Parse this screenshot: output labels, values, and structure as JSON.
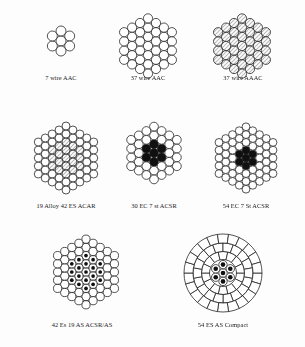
{
  "figure": {
    "background_color": "#fdfdfd",
    "stroke_color": "#1a1a1a",
    "fill_white": "#ffffff",
    "fill_hatched": "#b9b9b9",
    "fill_black": "#101010"
  },
  "diagrams": [
    {
      "id": "d1",
      "label": "7 wire AAC",
      "type": "round-strand",
      "total_wires": 7,
      "layers": [
        {
          "count": 1,
          "radius_factor": 0.0,
          "fill": "white"
        },
        {
          "count": 6,
          "radius_factor": 1.0,
          "fill": "white"
        }
      ],
      "wire_radius": 5.0,
      "outer_radius": 15,
      "core_fill": "white",
      "outer_fill": "white"
    },
    {
      "id": "d2",
      "label": "37 wire AAC",
      "type": "round-strand",
      "total_wires": 37,
      "layers": [
        {
          "count": 1,
          "radius_factor": 0.0,
          "fill": "white"
        },
        {
          "count": 6,
          "radius_factor": 1.0,
          "fill": "white"
        },
        {
          "count": 12,
          "radius_factor": 2.0,
          "fill": "white"
        },
        {
          "count": 18,
          "radius_factor": 3.0,
          "fill": "white"
        }
      ],
      "wire_radius": 4.6,
      "outer_radius": 32,
      "core_fill": "white",
      "outer_fill": "white"
    },
    {
      "id": "d3",
      "label": "37 wire AAAC",
      "type": "round-strand",
      "total_wires": 37,
      "layers": [
        {
          "count": 1,
          "radius_factor": 0.0,
          "fill": "hatched"
        },
        {
          "count": 6,
          "radius_factor": 1.0,
          "fill": "hatched"
        },
        {
          "count": 12,
          "radius_factor": 2.0,
          "fill": "hatched"
        },
        {
          "count": 18,
          "radius_factor": 3.0,
          "fill": "hatched"
        }
      ],
      "wire_radius": 4.6,
      "outer_radius": 32,
      "core_fill": "hatched",
      "outer_fill": "hatched"
    },
    {
      "id": "d4",
      "label": "19 Alloy 42 ES ACAR",
      "type": "round-strand",
      "total_wires": 61,
      "layers": [
        {
          "count": 1,
          "radius_factor": 0.0,
          "fill": "hatched"
        },
        {
          "count": 6,
          "radius_factor": 1.0,
          "fill": "hatched"
        },
        {
          "count": 12,
          "radius_factor": 2.0,
          "fill": "hatched"
        },
        {
          "count": 18,
          "radius_factor": 3.0,
          "fill": "white"
        },
        {
          "count": 24,
          "radius_factor": 4.0,
          "fill": "white"
        }
      ],
      "wire_radius": 4.0,
      "outer_radius": 36,
      "core_fill": "hatched",
      "outer_fill": "white"
    },
    {
      "id": "d5",
      "label": "30 EC 7 st ACSR",
      "type": "round-strand-steel-core",
      "total_wires": 37,
      "layers": [
        {
          "count": 1,
          "radius_factor": 0.0,
          "fill": "black"
        },
        {
          "count": 6,
          "radius_factor": 1.0,
          "fill": "black"
        },
        {
          "count": 12,
          "radius_factor": 2.0,
          "fill": "white"
        },
        {
          "count": 18,
          "radius_factor": 3.0,
          "fill": "white"
        }
      ],
      "wire_radius": 4.4,
      "outer_radius": 31,
      "core_fill": "black",
      "outer_fill": "white",
      "core_wires": 7,
      "outer_wires": 30
    },
    {
      "id": "d6",
      "label": "54 EC 7 St ACSR",
      "type": "round-strand-steel-core",
      "total_wires": 61,
      "layers": [
        {
          "count": 1,
          "radius_factor": 0.0,
          "fill": "black"
        },
        {
          "count": 6,
          "radius_factor": 1.0,
          "fill": "black"
        },
        {
          "count": 12,
          "radius_factor": 2.0,
          "fill": "white"
        },
        {
          "count": 18,
          "radius_factor": 3.0,
          "fill": "white"
        },
        {
          "count": 24,
          "radius_factor": 4.0,
          "fill": "white"
        }
      ],
      "wire_radius": 3.9,
      "outer_radius": 36,
      "core_fill": "black",
      "outer_fill": "white",
      "core_wires": 7,
      "outer_wires": 54
    },
    {
      "id": "d7",
      "label": "42 Es 19 AS ACSR/AS",
      "type": "round-strand-dotted-core",
      "total_wires": 61,
      "layers": [
        {
          "count": 1,
          "radius_factor": 0.0,
          "fill": "dotted"
        },
        {
          "count": 6,
          "radius_factor": 1.0,
          "fill": "dotted"
        },
        {
          "count": 12,
          "radius_factor": 2.0,
          "fill": "dotted"
        },
        {
          "count": 18,
          "radius_factor": 3.0,
          "fill": "white"
        },
        {
          "count": 24,
          "radius_factor": 4.0,
          "fill": "white"
        }
      ],
      "wire_radius": 4.1,
      "outer_radius": 38,
      "core_fill": "dotted",
      "outer_fill": "white",
      "core_wires": 19,
      "outer_wires": 42
    },
    {
      "id": "d8",
      "label": "54 ES AS Compact",
      "type": "trapezoidal-compact",
      "total_wires": 61,
      "core_wires": 7,
      "outer_wires": 54,
      "rings": [
        {
          "segments": 14,
          "r_inner": 13.5,
          "r_outer": 21.5
        },
        {
          "segments": 18,
          "r_inner": 21.5,
          "r_outer": 30.0
        },
        {
          "segments": 22,
          "r_inner": 30.0,
          "r_outer": 39.0
        }
      ],
      "core_wire_radius": 4.2,
      "outer_radius": 39,
      "core_fill": "dotted",
      "outer_fill": "white"
    }
  ],
  "layout": {
    "rows": [
      {
        "cells": [
          "d1",
          "d2",
          "d3"
        ]
      },
      {
        "cells": [
          "d4",
          "d5",
          "d6"
        ]
      },
      {
        "cells": [
          "d7",
          "d8"
        ]
      }
    ]
  }
}
